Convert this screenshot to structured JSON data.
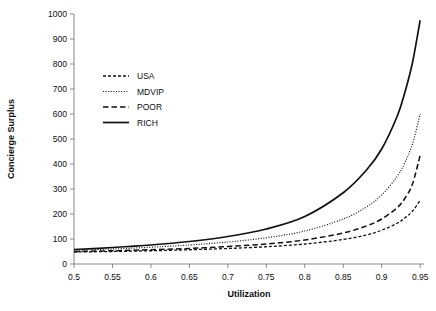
{
  "chart_data": {
    "type": "line",
    "title": "",
    "xlabel": "Utilization",
    "ylabel": "Concierge Surplus",
    "xlim": [
      0.5,
      0.955
    ],
    "ylim": [
      0,
      1000
    ],
    "grid": false,
    "legend_position": "upper-left-inside",
    "xticks": [
      "0.5",
      "0.55",
      "0.6",
      "0.65",
      "0.7",
      "0.75",
      "0.8",
      "0.85",
      "0.9",
      "0.95"
    ],
    "xtick_values": [
      0.5,
      0.55,
      0.6,
      0.65,
      0.7,
      0.75,
      0.8,
      0.85,
      0.9,
      0.95
    ],
    "yticks": [
      "0",
      "100",
      "200",
      "300",
      "400",
      "500",
      "600",
      "700",
      "800",
      "900",
      "1000"
    ],
    "ytick_values": [
      0,
      100,
      200,
      300,
      400,
      500,
      600,
      700,
      800,
      900,
      1000
    ],
    "x": [
      0.5,
      0.55,
      0.6,
      0.65,
      0.7,
      0.75,
      0.8,
      0.85,
      0.88,
      0.9,
      0.92,
      0.93,
      0.94,
      0.95
    ],
    "series": [
      {
        "name": "USA",
        "dash": "3,2",
        "width": 1.3,
        "color": "#111111",
        "values": [
          48,
          50,
          53,
          57,
          62,
          69,
          80,
          98,
          116,
          135,
          163,
          184,
          211,
          255
        ]
      },
      {
        "name": "MDVIP",
        "dash": "1,1.6",
        "width": 1.2,
        "color": "#111111",
        "values": [
          55,
          60,
          67,
          76,
          88,
          105,
          132,
          180,
          228,
          276,
          350,
          405,
          480,
          600
        ]
      },
      {
        "name": "POOR",
        "dash": "5.5,3",
        "width": 1.5,
        "color": "#111111",
        "values": [
          50,
          53,
          57,
          62,
          70,
          80,
          96,
          124,
          152,
          180,
          225,
          262,
          320,
          435
        ]
      },
      {
        "name": "RICH",
        "dash": "none",
        "width": 1.7,
        "color": "#111111",
        "values": [
          58,
          66,
          76,
          90,
          110,
          140,
          190,
          285,
          375,
          460,
          590,
          685,
          805,
          975
        ]
      }
    ],
    "legend_entries": [
      {
        "label": "USA",
        "dash": "3,2",
        "width": 1.3
      },
      {
        "label": "MDVIP",
        "dash": "1,1.6",
        "width": 1.2
      },
      {
        "label": "POOR",
        "dash": "5.5,3",
        "width": 1.5
      },
      {
        "label": "RICH",
        "dash": "none",
        "width": 1.7
      }
    ]
  }
}
